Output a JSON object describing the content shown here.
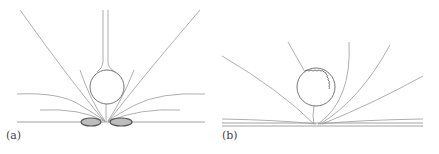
{
  "figure": {
    "panels": [
      {
        "id": "a",
        "label": "(a)"
      },
      {
        "id": "b",
        "label": "(b)"
      }
    ],
    "colors": {
      "line": "#9a9a9a",
      "circle": "#666666",
      "blob_fill": "#bdbdbd",
      "blob_stroke": "#555555",
      "wall": "#8a8a8a",
      "label": "#444444"
    }
  }
}
